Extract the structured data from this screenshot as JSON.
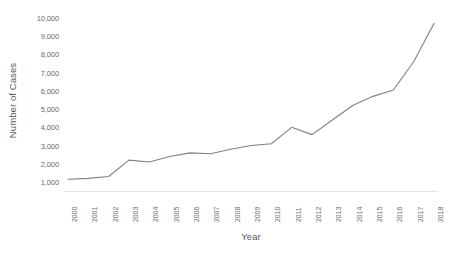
{
  "chart_data": {
    "type": "line",
    "title": "",
    "xlabel": "Year",
    "ylabel": "Number of Cases",
    "grid": false,
    "legend": false,
    "line_color": "#808080",
    "background_color": "#ffffff",
    "axis_label_color": "#6b6b6b",
    "xlim": [
      2000,
      2018
    ],
    "ylim": [
      0,
      10000
    ],
    "y_ticks": [
      1000,
      2000,
      3000,
      4000,
      5000,
      6000,
      7000,
      8000,
      9000,
      10000
    ],
    "y_tick_labels": [
      "1,000",
      "2,000",
      "3,000",
      "4,000",
      "5,000",
      "6,000",
      "7,000",
      "8,000",
      "9,000",
      "10,000"
    ],
    "x_tick_rotation": -90,
    "categories": [
      "2000",
      "2001",
      "2002",
      "2003",
      "2004",
      "2005",
      "2006",
      "2007",
      "2008",
      "2009",
      "2010",
      "2011",
      "2012",
      "2013",
      "2014",
      "2015",
      "2016",
      "2017",
      "2018"
    ],
    "values": [
      1150,
      1200,
      1300,
      2200,
      2100,
      2400,
      2600,
      2550,
      2800,
      3000,
      3100,
      4000,
      3600,
      4400,
      5200,
      5700,
      6050,
      7600,
      9700
    ]
  }
}
